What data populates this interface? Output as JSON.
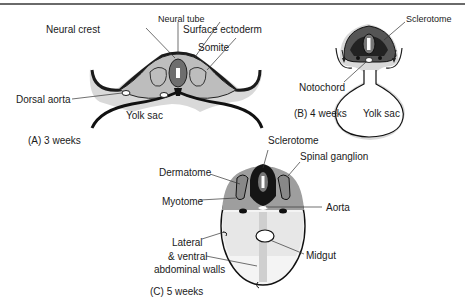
{
  "figure": {
    "panels": [
      {
        "caption": "(A) 3 weeks",
        "labels": {
          "neural_tube": "Neural tube",
          "neural_crest": "Neural crest",
          "surface_ectoderm": "Surface ectoderm",
          "somite": "Somite",
          "dorsal_aorta": "Dorsal aorta",
          "yolk_sac": "Yolk sac"
        }
      },
      {
        "caption": "(B) 4 weeks",
        "labels": {
          "sclerotome": "Sclerotome",
          "notochord": "Notochord",
          "yolk_sac": "Yolk sac"
        }
      },
      {
        "caption": "(C) 5 weeks",
        "labels": {
          "sclerotome": "Sclerotome",
          "spinal_ganglion": "Spinal ganglion",
          "dermatome": "Dermatome",
          "myotome": "Myotome",
          "aorta": "Aorta",
          "lateral_line1": "Lateral",
          "lateral_line2": "& ventral",
          "lateral_line3": "abdominal walls",
          "midgut": "Midgut"
        }
      }
    ]
  }
}
